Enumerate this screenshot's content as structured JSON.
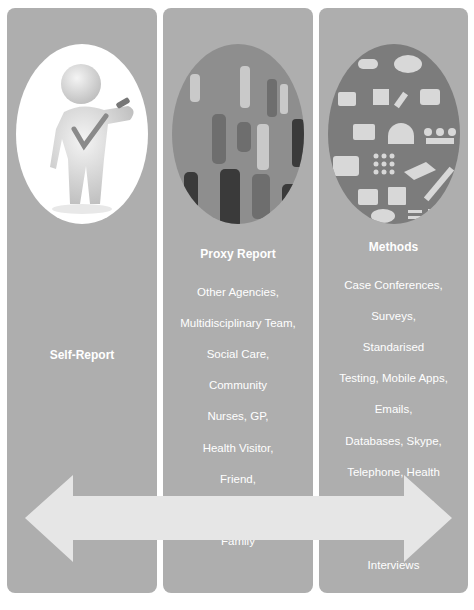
{
  "columns": [
    {
      "id": "self-report",
      "title": "Self-Report",
      "items": [],
      "image": "3d-figure-with-checkmark"
    },
    {
      "id": "proxy-report",
      "title": "Proxy Report",
      "items": [
        "Other Agencies,",
        "Multidisciplinary Team,",
        "Social Care,",
        "Community",
        "Nurses, GP,",
        "Health Visitor,",
        "Friend,",
        "Neighbours,",
        "Family"
      ],
      "image": "people-silhouettes"
    },
    {
      "id": "methods",
      "title": "Methods",
      "items": [
        "Case Conferences,",
        "Surveys,",
        "Standarised",
        "Testing, Mobile Apps,",
        "Emails,",
        "Databases, Skype,",
        "Telephone, Health",
        "Records, Letters,",
        "Conversation,",
        "Interviews"
      ],
      "image": "method-icons-collage"
    }
  ],
  "arrow": {
    "type": "double-headed-horizontal",
    "color": "#e6e6e6"
  },
  "colors": {
    "panel": "#aeaeae",
    "text": "#ffffff",
    "background": "#ffffff"
  }
}
